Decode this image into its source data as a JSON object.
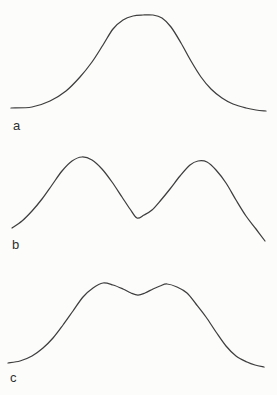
{
  "page": {
    "background": "#fcfcfb",
    "stroke_color": "#3e3e3e",
    "stroke_width": 1.25,
    "label_color": "#2f2f2f"
  },
  "panels": [
    {
      "id": "a",
      "label": "a",
      "shape": "unimodal-flat-top",
      "curve": {
        "points": [
          [
            11,
            108
          ],
          [
            32,
            107
          ],
          [
            50,
            101
          ],
          [
            66,
            91
          ],
          [
            80,
            77
          ],
          [
            92,
            62
          ],
          [
            103,
            45
          ],
          [
            113,
            29
          ],
          [
            123,
            20
          ],
          [
            133,
            16
          ],
          [
            143,
            15
          ],
          [
            153,
            15
          ],
          [
            162,
            18
          ],
          [
            171,
            27
          ],
          [
            181,
            43
          ],
          [
            191,
            61
          ],
          [
            201,
            77
          ],
          [
            211,
            89
          ],
          [
            222,
            98
          ],
          [
            233,
            104
          ],
          [
            246,
            108
          ],
          [
            256,
            110
          ],
          [
            266,
            111
          ]
        ]
      }
    },
    {
      "id": "b",
      "label": "b",
      "shape": "bimodal-deep-valley",
      "curve": {
        "points": [
          [
            12,
            228
          ],
          [
            22,
            221
          ],
          [
            32,
            211
          ],
          [
            42,
            199
          ],
          [
            52,
            185
          ],
          [
            62,
            171
          ],
          [
            72,
            161
          ],
          [
            82,
            157
          ],
          [
            92,
            160
          ],
          [
            102,
            169
          ],
          [
            112,
            182
          ],
          [
            122,
            197
          ],
          [
            130,
            209
          ],
          [
            137,
            218
          ],
          [
            144,
            215
          ],
          [
            152,
            210
          ],
          [
            161,
            200
          ],
          [
            170,
            189
          ],
          [
            180,
            176
          ],
          [
            190,
            165
          ],
          [
            198,
            161
          ],
          [
            207,
            162
          ],
          [
            216,
            170
          ],
          [
            226,
            183
          ],
          [
            236,
            200
          ],
          [
            246,
            216
          ],
          [
            256,
            229
          ],
          [
            265,
            241
          ]
        ]
      }
    },
    {
      "id": "c",
      "label": "c",
      "shape": "bimodal-shallow-dip",
      "curve": {
        "points": [
          [
            8,
            363
          ],
          [
            20,
            361
          ],
          [
            32,
            356
          ],
          [
            43,
            348
          ],
          [
            53,
            338
          ],
          [
            63,
            325
          ],
          [
            73,
            311
          ],
          [
            83,
            297
          ],
          [
            93,
            288
          ],
          [
            103,
            283
          ],
          [
            113,
            285
          ],
          [
            123,
            289
          ],
          [
            131,
            293
          ],
          [
            138,
            295
          ],
          [
            145,
            293
          ],
          [
            153,
            289
          ],
          [
            160,
            286
          ],
          [
            167,
            284
          ],
          [
            177,
            287
          ],
          [
            187,
            293
          ],
          [
            196,
            304
          ],
          [
            206,
            317
          ],
          [
            216,
            332
          ],
          [
            226,
            346
          ],
          [
            236,
            356
          ],
          [
            247,
            362
          ],
          [
            255,
            365
          ],
          [
            264,
            367
          ]
        ]
      }
    }
  ]
}
